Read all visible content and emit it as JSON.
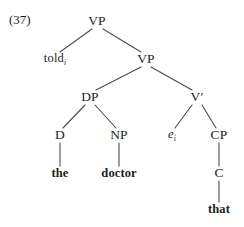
{
  "figure": {
    "example_number": "(37)",
    "cut_line": "",
    "width": 244,
    "height": 227,
    "background": "#ffffff",
    "line_color": "#4a4a52",
    "text_color": "#1d1d1d"
  },
  "tree": {
    "type": "syntax-tree",
    "nodes": [
      {
        "id": "vp-root",
        "label": "VP",
        "kind": "category",
        "x": 97,
        "y": 21
      },
      {
        "id": "told",
        "label": "told",
        "sub": "i",
        "kind": "lexical",
        "x": 55,
        "y": 59
      },
      {
        "id": "vp-inner",
        "label": "VP",
        "kind": "category",
        "x": 146,
        "y": 59
      },
      {
        "id": "dp",
        "label": "DP",
        "kind": "category",
        "x": 90,
        "y": 97
      },
      {
        "id": "vbar",
        "label": "V",
        "prime": "′",
        "kind": "category",
        "x": 197,
        "y": 97
      },
      {
        "id": "d",
        "label": "D",
        "kind": "category",
        "x": 60,
        "y": 135
      },
      {
        "id": "np",
        "label": "NP",
        "kind": "category",
        "x": 119,
        "y": 135
      },
      {
        "id": "trace",
        "label": "e",
        "sub": "i",
        "kind": "trace",
        "x": 172,
        "y": 135
      },
      {
        "id": "cp",
        "label": "CP",
        "kind": "category",
        "x": 219,
        "y": 135
      },
      {
        "id": "the",
        "label": "the",
        "kind": "terminal",
        "x": 60,
        "y": 173
      },
      {
        "id": "doctor",
        "label": "doctor",
        "kind": "terminal",
        "x": 119,
        "y": 173
      },
      {
        "id": "c",
        "label": "C",
        "kind": "category",
        "x": 219,
        "y": 173
      },
      {
        "id": "that",
        "label": "that",
        "kind": "terminal",
        "x": 219,
        "y": 209
      }
    ],
    "edges": [
      {
        "from": "vp-root",
        "to": "told",
        "x1": 92,
        "y1": 29,
        "x2": 60,
        "y2": 52
      },
      {
        "from": "vp-root",
        "to": "vp-inner",
        "x1": 103,
        "y1": 29,
        "x2": 141,
        "y2": 52
      },
      {
        "from": "vp-inner",
        "to": "dp",
        "x1": 141,
        "y1": 67,
        "x2": 96,
        "y2": 90
      },
      {
        "from": "vp-inner",
        "to": "vbar",
        "x1": 151,
        "y1": 67,
        "x2": 192,
        "y2": 90
      },
      {
        "from": "dp",
        "to": "d",
        "x1": 85,
        "y1": 105,
        "x2": 63,
        "y2": 128
      },
      {
        "from": "dp",
        "to": "np",
        "x1": 95,
        "y1": 105,
        "x2": 116,
        "y2": 128
      },
      {
        "from": "vbar",
        "to": "trace",
        "x1": 192,
        "y1": 105,
        "x2": 175,
        "y2": 128
      },
      {
        "from": "vbar",
        "to": "cp",
        "x1": 202,
        "y1": 105,
        "x2": 216,
        "y2": 128
      },
      {
        "from": "d",
        "to": "the",
        "x1": 60,
        "y1": 143,
        "x2": 60,
        "y2": 166
      },
      {
        "from": "np",
        "to": "doctor",
        "x1": 119,
        "y1": 143,
        "x2": 119,
        "y2": 166
      },
      {
        "from": "cp",
        "to": "c",
        "x1": 219,
        "y1": 143,
        "x2": 219,
        "y2": 166
      },
      {
        "from": "c",
        "to": "that",
        "x1": 219,
        "y1": 181,
        "x2": 219,
        "y2": 202
      }
    ]
  }
}
